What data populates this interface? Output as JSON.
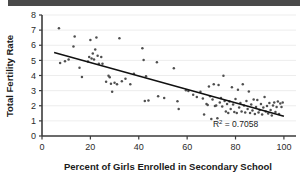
{
  "chart_data": {
    "type": "scatter",
    "title": "",
    "xlabel": "Percent of Girls Enrolled in Secondary School",
    "ylabel": "Total Fertility Rate",
    "xlim": [
      0,
      105
    ],
    "ylim": [
      0,
      8
    ],
    "xticks": [
      0,
      20,
      40,
      60,
      80,
      100
    ],
    "yticks": [
      0,
      1,
      2,
      3,
      4,
      5,
      6,
      7,
      8
    ],
    "xtick_labels": [
      "0",
      "20",
      "40",
      "60",
      "80",
      "100"
    ],
    "ytick_labels": [
      "0",
      "1",
      "2",
      "3",
      "4",
      "5",
      "6",
      "7",
      "8"
    ],
    "grid": "horizontal",
    "legend": "none",
    "annotations": [
      {
        "text": "R2 = 0.7058",
        "display_prefix": "R",
        "display_sup": "2",
        "display_suffix": " = 0.7058",
        "x": 80,
        "y": 0.62
      }
    ],
    "r_squared": 0.7058,
    "trendline": {
      "type": "linear",
      "x_start": 5,
      "y_start": 5.52,
      "x_end": 100,
      "y_end": 1.3,
      "slope": -0.0444,
      "intercept": 5.74,
      "color": "#111111"
    },
    "point_color": "#4f4f4f",
    "points": [
      [
        7.0,
        7.12
      ],
      [
        7.5,
        4.82
      ],
      [
        9.5,
        4.95
      ],
      [
        11.0,
        5.05
      ],
      [
        13.0,
        5.92
      ],
      [
        13.5,
        6.58
      ],
      [
        15.5,
        4.52
      ],
      [
        16.5,
        3.9
      ],
      [
        19.0,
        4.92
      ],
      [
        19.5,
        5.22
      ],
      [
        20.0,
        6.34
      ],
      [
        20.5,
        5.12
      ],
      [
        21.0,
        5.45
      ],
      [
        21.5,
        5.05
      ],
      [
        22.0,
        5.72
      ],
      [
        22.5,
        6.52
      ],
      [
        23.0,
        5.3
      ],
      [
        23.5,
        4.78
      ],
      [
        24.5,
        5.22
      ],
      [
        25.0,
        4.78
      ],
      [
        26.5,
        3.58
      ],
      [
        27.5,
        3.98
      ],
      [
        28.0,
        3.88
      ],
      [
        28.5,
        3.45
      ],
      [
        29.0,
        2.92
      ],
      [
        30.0,
        3.52
      ],
      [
        31.0,
        3.42
      ],
      [
        32.0,
        6.46
      ],
      [
        33.0,
        3.62
      ],
      [
        34.5,
        3.78
      ],
      [
        36.5,
        3.42
      ],
      [
        38.0,
        4.12
      ],
      [
        41.5,
        5.8
      ],
      [
        42.0,
        5.02
      ],
      [
        42.5,
        2.32
      ],
      [
        43.0,
        3.95
      ],
      [
        44.0,
        2.35
      ],
      [
        47.5,
        4.88
      ],
      [
        48.0,
        2.62
      ],
      [
        50.5,
        2.52
      ],
      [
        54.5,
        4.48
      ],
      [
        56.0,
        2.3
      ],
      [
        56.5,
        1.78
      ],
      [
        59.5,
        3.02
      ],
      [
        60.5,
        2.98
      ],
      [
        62.5,
        2.72
      ],
      [
        64.0,
        2.58
      ],
      [
        65.5,
        2.92
      ],
      [
        66.5,
        2.48
      ],
      [
        67.0,
        1.42
      ],
      [
        68.0,
        2.12
      ],
      [
        68.5,
        2.05
      ],
      [
        69.0,
        3.28
      ],
      [
        69.5,
        2.62
      ],
      [
        70.0,
        1.12
      ],
      [
        70.5,
        2.42
      ],
      [
        71.0,
        3.42
      ],
      [
        71.5,
        1.98
      ],
      [
        72.0,
        2.02
      ],
      [
        72.5,
        1.18
      ],
      [
        73.0,
        3.38
      ],
      [
        73.5,
        2.22
      ],
      [
        74.0,
        2.52
      ],
      [
        74.5,
        1.95
      ],
      [
        75.0,
        3.98
      ],
      [
        75.5,
        2.32
      ],
      [
        76.0,
        1.62
      ],
      [
        76.5,
        2.12
      ],
      [
        77.0,
        1.52
      ],
      [
        77.5,
        2.28
      ],
      [
        78.0,
        1.78
      ],
      [
        78.5,
        3.22
      ],
      [
        79.0,
        2.08
      ],
      [
        79.5,
        1.58
      ],
      [
        80.0,
        2.45
      ],
      [
        80.5,
        1.52
      ],
      [
        81.0,
        3.05
      ],
      [
        81.5,
        1.88
      ],
      [
        82.0,
        2.18
      ],
      [
        82.5,
        1.62
      ],
      [
        83.0,
        3.42
      ],
      [
        83.5,
        2.02
      ],
      [
        84.0,
        1.55
      ],
      [
        84.5,
        2.32
      ],
      [
        85.0,
        1.78
      ],
      [
        85.5,
        2.95
      ],
      [
        86.0,
        1.52
      ],
      [
        86.5,
        2.08
      ],
      [
        87.0,
        1.68
      ],
      [
        87.5,
        2.42
      ],
      [
        88.0,
        1.45
      ],
      [
        88.5,
        1.92
      ],
      [
        89.0,
        2.38
      ],
      [
        89.5,
        1.55
      ],
      [
        90.0,
        1.72
      ],
      [
        90.5,
        2.12
      ],
      [
        91.0,
        1.42
      ],
      [
        91.5,
        1.88
      ],
      [
        92.0,
        2.58
      ],
      [
        92.5,
        1.62
      ],
      [
        93.0,
        1.98
      ],
      [
        93.5,
        1.48
      ],
      [
        94.0,
        2.18
      ],
      [
        94.5,
        1.72
      ],
      [
        95.0,
        1.35
      ],
      [
        95.5,
        2.02
      ],
      [
        96.0,
        2.22
      ],
      [
        96.5,
        1.58
      ],
      [
        97.0,
        1.92
      ],
      [
        97.5,
        2.28
      ],
      [
        98.0,
        1.45
      ],
      [
        98.5,
        2.15
      ],
      [
        99.0,
        1.92
      ],
      [
        99.5,
        2.22
      ]
    ]
  },
  "decorations": {
    "top_bar_color": "#4a4a4a"
  }
}
